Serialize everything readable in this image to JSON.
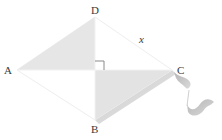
{
  "figure": {
    "shape": "kite",
    "vertices": {
      "A": {
        "label": "A",
        "x": 17,
        "y": 70
      },
      "B": {
        "label": "B",
        "x": 95,
        "y": 120
      },
      "C": {
        "label": "C",
        "x": 172,
        "y": 70
      },
      "D": {
        "label": "D",
        "x": 95,
        "y": 17
      }
    },
    "side_label": {
      "text": "x",
      "side": "DC"
    },
    "right_angle_marker": {
      "at": "diagonal intersection"
    },
    "shaded_regions": [
      "triangle A-D-O",
      "triangle O-B-C"
    ],
    "colors": {
      "shade": "#e6e6e6",
      "edge": "#f0f0f0",
      "marker": "#8a8a8a",
      "tail": "#c8c8c8",
      "label": "#3a3a3a"
    }
  }
}
